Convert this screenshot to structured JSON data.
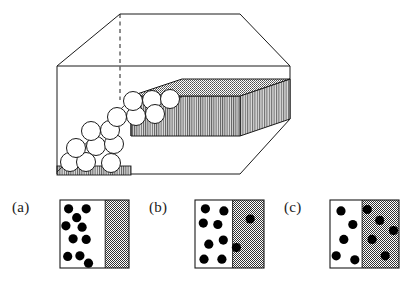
{
  "figure": {
    "title": "",
    "domain_kind": "schematic-diagram",
    "description_kind": "granular particle settling / compaction across an interface"
  },
  "colors": {
    "stroke": "#1a1a1a",
    "dither_gray": "#8a8a8a",
    "dither_gray_light": "#a9a9a9",
    "particle_fill": "#000000",
    "circle_fill": "#ffffff",
    "background": "#ffffff",
    "stripe_dark": "#4a4a4a",
    "stripe_light": "#d8d8d8"
  },
  "box": {
    "name": "3d-container-box",
    "front_top_left": [
      57,
      66
    ],
    "front_top_right": [
      290,
      66
    ],
    "front_bottom_left": [
      57,
      174
    ],
    "front_bottom_right": [
      290,
      174
    ],
    "top_back_left": [
      120,
      14
    ],
    "top_back_right": [
      240,
      14
    ],
    "hidden_vertical_edge_x": 120,
    "hidden_vertical_edge_y0": 14,
    "hidden_vertical_edge_y1": 100,
    "dashed": true
  },
  "pile": {
    "name": "particle-pile",
    "slope_from": [
      57,
      174
    ],
    "slope_to": [
      180,
      96
    ],
    "circle_radius": 9.5,
    "circles": [
      [
        70,
        162
      ],
      [
        86,
        162
      ],
      [
        111,
        163
      ],
      [
        76,
        148
      ],
      [
        95,
        146
      ],
      [
        113,
        144
      ],
      [
        90,
        131
      ],
      [
        109,
        130
      ],
      [
        116,
        117
      ],
      [
        134,
        117
      ],
      [
        132,
        101
      ],
      [
        150,
        100
      ],
      [
        152,
        114
      ],
      [
        158,
        98
      ]
    ]
  },
  "slab": {
    "name": "compacted-slab",
    "top_face": [
      [
        131,
        96
      ],
      [
        182,
        79
      ],
      [
        290,
        79
      ],
      [
        240,
        96
      ]
    ],
    "front_face": [
      [
        131,
        96
      ],
      [
        240,
        96
      ],
      [
        240,
        136
      ],
      [
        131,
        136
      ]
    ],
    "side_face": [
      [
        240,
        96
      ],
      [
        290,
        79
      ],
      [
        290,
        119
      ],
      [
        240,
        136
      ]
    ],
    "top_pattern": "checker-dither",
    "front_pattern": "vertical-stripes",
    "side_pattern": "vertical-stripes"
  },
  "base": {
    "name": "striped-floor-strip",
    "rect": [
      57,
      166,
      74,
      9
    ],
    "pattern": "vertical-stripes"
  },
  "panels": [
    {
      "id": "a",
      "label": "(a)",
      "name": "panel-a",
      "frame": {
        "x": 60,
        "y": 200,
        "w": 69,
        "h": 68
      },
      "divider_fraction": 0.655,
      "left_region": "dilute",
      "right_region": "dense",
      "dot_radius": 4.6,
      "dots_left": [
        [
          0.19,
          0.13
        ],
        [
          0.58,
          0.13
        ],
        [
          0.37,
          0.26
        ],
        [
          0.13,
          0.38
        ],
        [
          0.49,
          0.4
        ],
        [
          0.29,
          0.57
        ],
        [
          0.58,
          0.58
        ],
        [
          0.17,
          0.83
        ],
        [
          0.44,
          0.82
        ],
        [
          0.63,
          0.93
        ]
      ],
      "dots_right": []
    },
    {
      "id": "b",
      "label": "(b)",
      "name": "panel-b",
      "frame": {
        "x": 195,
        "y": 200,
        "w": 69,
        "h": 68
      },
      "divider_fraction": 0.545,
      "left_region": "dilute",
      "right_region": "dense",
      "dot_radius": 4.6,
      "dots_left": [
        [
          0.15,
          0.13
        ],
        [
          0.42,
          0.16
        ],
        [
          0.12,
          0.34
        ],
        [
          0.33,
          0.36
        ],
        [
          0.41,
          0.59
        ],
        [
          0.2,
          0.65
        ],
        [
          0.13,
          0.87
        ],
        [
          0.39,
          0.87
        ]
      ],
      "dots_right": [
        [
          0.8,
          0.28
        ],
        [
          0.6,
          0.7
        ]
      ]
    },
    {
      "id": "c",
      "label": "(c)",
      "name": "panel-c",
      "frame": {
        "x": 330,
        "y": 200,
        "w": 69,
        "h": 68
      },
      "divider_fraction": 0.465,
      "left_region": "dilute",
      "right_region": "dense",
      "dot_radius": 4.6,
      "dots_left": [
        [
          0.16,
          0.16
        ],
        [
          0.33,
          0.36
        ],
        [
          0.2,
          0.58
        ],
        [
          0.09,
          0.82
        ],
        [
          0.36,
          0.88
        ]
      ],
      "dots_right": [
        [
          0.54,
          0.14
        ],
        [
          0.72,
          0.3
        ],
        [
          0.92,
          0.45
        ],
        [
          0.61,
          0.58
        ],
        [
          0.8,
          0.82
        ]
      ]
    }
  ]
}
